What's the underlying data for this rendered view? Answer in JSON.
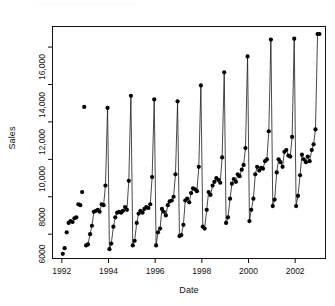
{
  "chart": {
    "type": "scatter-line",
    "xlabel": "Date",
    "ylabel": "Sales",
    "background": "#ffffff",
    "foreground": "#111111",
    "point_color": "#000000",
    "line_color": "#1a1a1a"
  },
  "axes": {
    "x_ticks": [
      "1992",
      "1994",
      "1996",
      "1998",
      "2000",
      "2002"
    ],
    "y_ticks": [
      "6000",
      "8000",
      "10,000",
      "12,000",
      "14,000",
      "16,000"
    ],
    "xlim": [
      1991.6,
      2003.3
    ],
    "ylim": [
      4700,
      17100
    ],
    "grid": false,
    "box": true
  },
  "chart_data": {
    "type": "line",
    "title": "",
    "subtitle": "",
    "xlabel": "Date",
    "ylabel": "Sales",
    "xlim": [
      1991.6,
      2003.3
    ],
    "ylim": [
      4700,
      17100
    ],
    "grid": false,
    "legend": "none",
    "x_tick_values": [
      1992,
      1994,
      1996,
      1998,
      2000,
      2002
    ],
    "x_tick_labels": [
      "1992",
      "1994",
      "1996",
      "1998",
      "2000",
      "2002"
    ],
    "y_tick_values": [
      6000,
      8000,
      10000,
      12000,
      14000,
      16000
    ],
    "y_tick_labels": [
      "6000",
      "8000",
      "10,000",
      "12,000",
      "14,000",
      "16,000"
    ],
    "series": [
      {
        "name": "Sales",
        "marker": "filled-circle",
        "line": true,
        "line_starts_at_index": 13,
        "x": [
          1992.04,
          1992.12,
          1992.21,
          1992.29,
          1992.37,
          1992.46,
          1992.54,
          1992.62,
          1992.71,
          1992.79,
          1992.87,
          1992.96,
          1993.04,
          1993.12,
          1993.21,
          1993.29,
          1993.37,
          1993.46,
          1993.54,
          1993.62,
          1993.71,
          1993.79,
          1993.87,
          1993.96,
          1994.04,
          1994.12,
          1994.21,
          1994.29,
          1994.37,
          1994.46,
          1994.54,
          1994.62,
          1994.71,
          1994.79,
          1994.87,
          1994.96,
          1995.04,
          1995.12,
          1995.21,
          1995.29,
          1995.37,
          1995.46,
          1995.54,
          1995.62,
          1995.71,
          1995.79,
          1995.87,
          1995.96,
          1996.04,
          1996.12,
          1996.21,
          1996.29,
          1996.37,
          1996.46,
          1996.54,
          1996.62,
          1996.71,
          1996.79,
          1996.87,
          1996.96,
          1997.04,
          1997.12,
          1997.21,
          1997.29,
          1997.37,
          1997.46,
          1997.54,
          1997.62,
          1997.71,
          1997.79,
          1997.87,
          1997.96,
          1998.04,
          1998.12,
          1998.21,
          1998.29,
          1998.37,
          1998.46,
          1998.54,
          1998.62,
          1998.71,
          1998.79,
          1998.87,
          1998.96,
          1999.04,
          1999.12,
          1999.21,
          1999.29,
          1999.37,
          1999.46,
          1999.54,
          1999.62,
          1999.71,
          1999.79,
          1999.87,
          1999.96,
          2000.04,
          2000.12,
          2000.21,
          2000.29,
          2000.37,
          2000.46,
          2000.54,
          2000.62,
          2000.71,
          2000.79,
          2000.87,
          2000.96,
          2001.04,
          2001.12,
          2001.21,
          2001.29,
          2001.37,
          2001.46,
          2001.54,
          2001.62,
          2001.71,
          2001.79,
          2001.87,
          2001.96,
          2002.04,
          2002.12,
          2002.21,
          2002.29,
          2002.37,
          2002.46,
          2002.54,
          2002.62,
          2002.71,
          2002.79,
          2002.87,
          2002.96,
          2003.04
        ],
        "y": [
          4950,
          5250,
          6100,
          6600,
          6700,
          6650,
          6850,
          6900,
          7600,
          7550,
          8250,
          12800,
          5400,
          5450,
          6000,
          6450,
          7200,
          7250,
          7300,
          7200,
          7600,
          7550,
          8600,
          12750,
          5200,
          5500,
          6400,
          6900,
          7150,
          7200,
          7150,
          7250,
          7450,
          7300,
          8850,
          13400,
          5400,
          5650,
          6600,
          7100,
          7250,
          7150,
          7350,
          7450,
          7400,
          7600,
          9050,
          13200,
          5400,
          6100,
          6300,
          7350,
          7200,
          7000,
          7550,
          7750,
          7800,
          8000,
          9200,
          13100,
          5900,
          5950,
          6500,
          7800,
          7900,
          7700,
          8200,
          8450,
          8400,
          8300,
          9600,
          13950,
          6400,
          6300,
          7300,
          8250,
          8100,
          8600,
          8800,
          9000,
          8900,
          8750,
          10100,
          14650,
          6600,
          6900,
          7900,
          8700,
          8950,
          8800,
          9200,
          9100,
          9450,
          9700,
          10600,
          15500,
          6700,
          7300,
          7900,
          9200,
          9600,
          9400,
          9550,
          9500,
          9900,
          10000,
          11500,
          16400,
          7500,
          7850,
          9300,
          10000,
          9850,
          9600,
          10400,
          10500,
          10200,
          10150,
          11200,
          16450,
          7500,
          8050,
          9150,
          10250,
          10000,
          9850,
          10150,
          9900,
          10500,
          10800,
          11600,
          16700,
          16700
        ]
      }
    ]
  }
}
